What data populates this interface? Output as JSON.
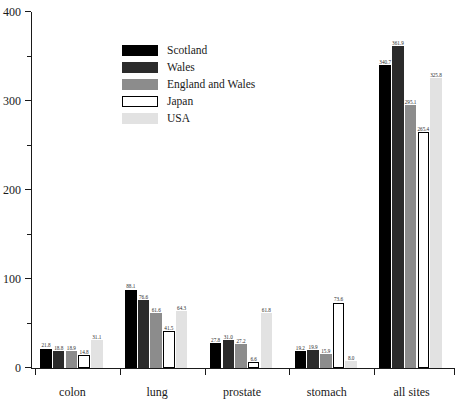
{
  "chart_data": {
    "type": "bar",
    "title": "",
    "subtitle": "",
    "xlabel": "",
    "ylabel": "",
    "categories": [
      "colon",
      "lung",
      "prostate",
      "stomach",
      "all sites"
    ],
    "series": [
      {
        "name": "Scotland",
        "color": "#000000",
        "border": "#000000",
        "values": [
          21.8,
          88.1,
          27.8,
          19.2,
          340.7
        ]
      },
      {
        "name": "Wales",
        "color": "#2b2b2b",
        "border": "#2b2b2b",
        "values": [
          18.8,
          76.6,
          31.0,
          19.9,
          361.9
        ]
      },
      {
        "name": "England and Wales",
        "color": "#8c8c8c",
        "border": "#8c8c8c",
        "values": [
          18.9,
          61.6,
          27.2,
          15.9,
          295.1
        ]
      },
      {
        "name": "Japan",
        "color": "#ffffff",
        "border": "#000000",
        "values": [
          14.8,
          41.5,
          6.6,
          73.6,
          265.4
        ]
      },
      {
        "name": "USA",
        "color": "#e2e2e2",
        "border": "#e2e2e2",
        "values": [
          31.1,
          64.3,
          61.8,
          8.0,
          325.8
        ]
      }
    ],
    "value_labels": [
      [
        "21.8",
        "18.8",
        "18.9",
        "14.8",
        "31.1"
      ],
      [
        "88.1",
        "76.6",
        "61.6",
        "41.5",
        "64.3"
      ],
      [
        "27.8",
        "31.0",
        "27.2",
        "6.6",
        "61.8"
      ],
      [
        "19.2",
        "19.9",
        "15.9",
        "73.6",
        "8.0"
      ],
      [
        "340.7",
        "361.9",
        "295.1",
        "265.4",
        "325.8"
      ]
    ],
    "ylim": [
      0,
      400
    ],
    "yticks": [
      0,
      100,
      200,
      300,
      400
    ],
    "ytick_labels": [
      "0",
      "100",
      "200",
      "300",
      "400"
    ],
    "yticks_minor": [
      50,
      150,
      250,
      350
    ],
    "grid": false,
    "legend_position": "upper-left-inside"
  }
}
